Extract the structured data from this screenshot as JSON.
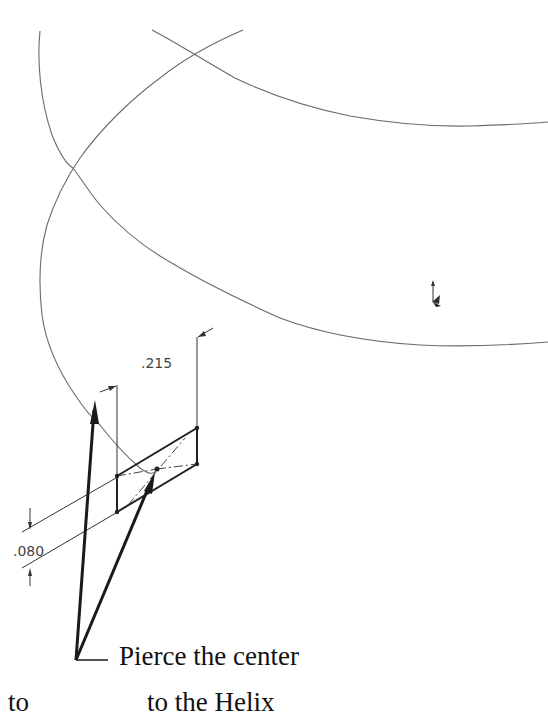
{
  "diagram": {
    "dimensions": {
      "width_label": ".215",
      "height_label": ".080"
    },
    "annotation": {
      "line1": "Pierce the center",
      "line2": "to the Helix"
    },
    "fragment_text": "to",
    "icons": {
      "origin": "coordinate-origin-icon"
    },
    "colors": {
      "curve": "#6a6a6a",
      "sketch": "#222222",
      "leader": "#1a1a1a",
      "background": "#ffffff"
    }
  }
}
